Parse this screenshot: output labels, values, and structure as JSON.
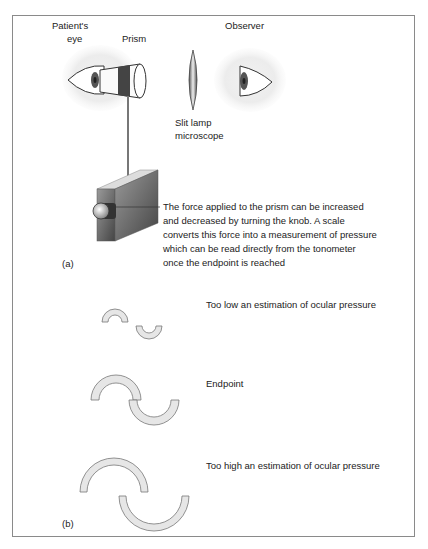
{
  "figure": {
    "panel_a": {
      "tag": "(a)",
      "labels": {
        "patients_eye_line1": "Patient's",
        "patients_eye_line2": "eye",
        "prism": "Prism",
        "observer": "Observer",
        "slit_lamp_line1": "Slit lamp",
        "slit_lamp_line2": "microscope"
      },
      "description": [
        "The force applied to the prism can be increased",
        "and decreased by turning the knob. A scale",
        "converts this force into a measurement of pressure",
        "which can be read directly from the tonometer",
        "once the endpoint is reached"
      ]
    },
    "panel_b": {
      "tag": "(b)",
      "states": [
        {
          "label": "Too low an estimation of ocular pressure"
        },
        {
          "label": "Endpoint"
        },
        {
          "label": "Too high an estimation of ocular pressure"
        }
      ]
    },
    "colors": {
      "frame": "#8a8a8a",
      "semicircle_fill": "#e6e6e6",
      "semicircle_stroke": "#777777",
      "eye_halo": "#eeeeee",
      "device_dark": "#555555"
    }
  }
}
